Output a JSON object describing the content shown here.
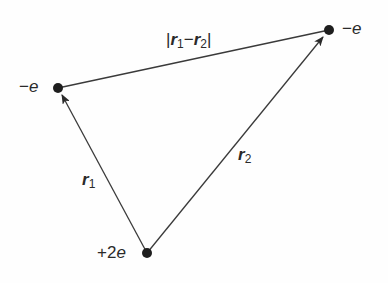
{
  "diagram": {
    "title": "",
    "nodes": [
      {
        "id": "left",
        "label_sign": "−",
        "label_sym": "e",
        "x": 58,
        "y": 88
      },
      {
        "id": "right",
        "label_sign": "−",
        "label_sym": "e",
        "x": 329,
        "y": 30
      },
      {
        "id": "bottom",
        "label_sign": "+2",
        "label_sym": "e",
        "x": 147,
        "y": 253
      }
    ],
    "edges": [
      {
        "from": "bottom",
        "to": "left",
        "arrow": true,
        "label_sym": "r",
        "label_sub": "1"
      },
      {
        "from": "bottom",
        "to": "right",
        "arrow": true,
        "label_sym": "r",
        "label_sub": "2"
      },
      {
        "from": "left",
        "to": "right",
        "arrow": false,
        "label_open": "|",
        "label_sym1": "r",
        "label_sub1": "1",
        "label_minus": "−",
        "label_sym2": "r",
        "label_sub2": "2",
        "label_close": "|"
      }
    ],
    "colors": {
      "line": "#3a3a3a",
      "dot": "#1e1e1e",
      "text": "#2a2a2a"
    }
  }
}
